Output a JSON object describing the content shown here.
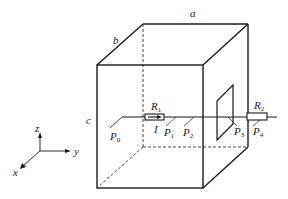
{
  "diagram": {
    "type": "physics-box-with-wire",
    "edge_labels": {
      "a": "a",
      "b": "b",
      "c": "c"
    },
    "axes": {
      "x": "x",
      "y": "y",
      "z": "z"
    },
    "resistors": [
      {
        "name": "R",
        "sub": "1"
      },
      {
        "name": "R",
        "sub": "2"
      }
    ],
    "current_label": "I",
    "points": [
      {
        "name": "P",
        "sub": "0"
      },
      {
        "name": "P",
        "sub": "1"
      },
      {
        "name": "P",
        "sub": "2"
      },
      {
        "name": "P",
        "sub": "3"
      },
      {
        "name": "P",
        "sub": "4"
      }
    ],
    "colors": {
      "line": "#1a1a1a",
      "background": "#ffffff"
    }
  }
}
